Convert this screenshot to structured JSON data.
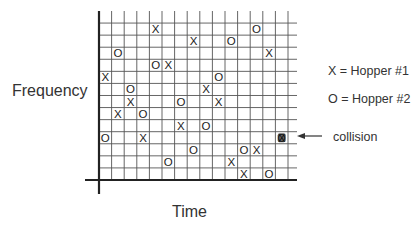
{
  "chart_data": {
    "type": "scatter",
    "title": "",
    "xlabel": "Time",
    "ylabel": "Frequency",
    "grid": true,
    "grid_columns": 15,
    "grid_rows": 14,
    "row_order": "top-to-bottom",
    "legend": [
      {
        "symbol": "X",
        "label": "X = Hopper #1"
      },
      {
        "symbol": "O",
        "label": "O = Hopper #2"
      }
    ],
    "annotation": {
      "text": "collision",
      "col": 14,
      "row": 10,
      "arrow": true
    },
    "series": [
      {
        "name": "Hopper #1",
        "symbol": "X",
        "points": [
          {
            "col": 4,
            "row": 1
          },
          {
            "col": 7,
            "row": 2
          },
          {
            "col": 13,
            "row": 3
          },
          {
            "col": 5,
            "row": 4
          },
          {
            "col": 0,
            "row": 5
          },
          {
            "col": 8,
            "row": 6
          },
          {
            "col": 2,
            "row": 7
          },
          {
            "col": 9,
            "row": 7
          },
          {
            "col": 1,
            "row": 8
          },
          {
            "col": 6,
            "row": 9
          },
          {
            "col": 3,
            "row": 10
          },
          {
            "col": 12,
            "row": 11
          },
          {
            "col": 10,
            "row": 12
          },
          {
            "col": 11,
            "row": 13
          },
          {
            "col": 14,
            "row": 10
          }
        ]
      },
      {
        "name": "Hopper #2",
        "symbol": "O",
        "points": [
          {
            "col": 12,
            "row": 1
          },
          {
            "col": 10,
            "row": 2
          },
          {
            "col": 1,
            "row": 3
          },
          {
            "col": 4,
            "row": 4
          },
          {
            "col": 9,
            "row": 5
          },
          {
            "col": 2,
            "row": 6
          },
          {
            "col": 6,
            "row": 7
          },
          {
            "col": 3,
            "row": 8
          },
          {
            "col": 8,
            "row": 9
          },
          {
            "col": 0,
            "row": 10
          },
          {
            "col": 7,
            "row": 11
          },
          {
            "col": 11,
            "row": 11
          },
          {
            "col": 5,
            "row": 12
          },
          {
            "col": 13,
            "row": 13
          },
          {
            "col": 14,
            "row": 10
          }
        ]
      }
    ]
  },
  "labels": {
    "y_axis": "Frequency",
    "x_axis": "Time",
    "legend_x": "X = Hopper #1",
    "legend_o": "O = Hopper #2",
    "collision": "collision"
  },
  "colors": {
    "grid": "#555555",
    "axis": "#222222",
    "marks": "#222222",
    "collision_fill": "#666666"
  }
}
